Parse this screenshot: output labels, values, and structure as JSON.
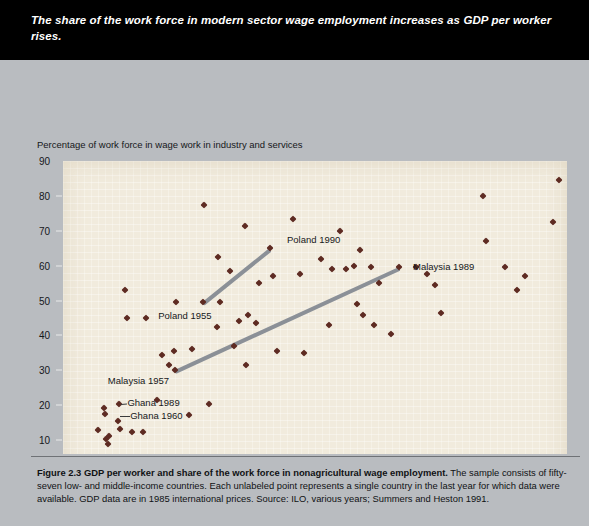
{
  "header": {
    "title": "The share of the work force in modern sector wage employment increases as GDP per worker rises."
  },
  "caption": {
    "figure_label": "Figure 2.3",
    "figure_title": "GDP per worker and share of the work force in nonagricultural wage employment.",
    "body": "The sample consists of fifty-seven low- and middle-income countries. Each unlabeled point represents a single country in the last year for which data were available. GDP data are in 1985 international prices. Source: ILO, various years; Summers and Heston 1991."
  },
  "chart_data": {
    "type": "scatter",
    "title": "",
    "ylabel": "Percentage of work force in wage work in industry and services",
    "xlabel": "GDP per worker (thousands of dollars)",
    "xlim": [
      0,
      18
    ],
    "ylim": [
      0,
      90
    ],
    "xticks": [
      0,
      2,
      4,
      6,
      8,
      10,
      12,
      14,
      16,
      18
    ],
    "yticks": [
      0,
      10,
      20,
      30,
      40,
      50,
      60,
      70,
      80,
      90
    ],
    "grid": false,
    "legend": "none",
    "plot_background": "#f1ebdd",
    "marker_color": "#5e2b22",
    "trend_color": "#8b9097",
    "points": [
      [
        1.25,
        13.0
      ],
      [
        1.45,
        19.2
      ],
      [
        1.5,
        17.5
      ],
      [
        1.55,
        10.2
      ],
      [
        1.6,
        9.0
      ],
      [
        1.65,
        11.3
      ],
      [
        1.95,
        15.5
      ],
      [
        2.0,
        20.3
      ],
      [
        2.05,
        13.2
      ],
      [
        2.2,
        53.0
      ],
      [
        2.3,
        45.0
      ],
      [
        2.45,
        12.3
      ],
      [
        2.85,
        12.3
      ],
      [
        2.95,
        45.0
      ],
      [
        3.35,
        21.5
      ],
      [
        3.55,
        34.5
      ],
      [
        3.8,
        31.5
      ],
      [
        3.95,
        35.5
      ],
      [
        4.0,
        30.0
      ],
      [
        4.05,
        49.5
      ],
      [
        4.5,
        17.2
      ],
      [
        4.6,
        36.0
      ],
      [
        5.0,
        49.5
      ],
      [
        5.05,
        77.5
      ],
      [
        5.2,
        20.3
      ],
      [
        5.5,
        42.5
      ],
      [
        5.55,
        62.5
      ],
      [
        5.6,
        49.5
      ],
      [
        5.95,
        58.5
      ],
      [
        6.1,
        37.0
      ],
      [
        6.3,
        44.0
      ],
      [
        6.5,
        71.5
      ],
      [
        6.55,
        31.5
      ],
      [
        6.6,
        46.0
      ],
      [
        6.9,
        43.5
      ],
      [
        7.0,
        55.0
      ],
      [
        7.4,
        65.0
      ],
      [
        7.5,
        57.0
      ],
      [
        7.65,
        35.5
      ],
      [
        8.2,
        73.5
      ],
      [
        8.45,
        57.5
      ],
      [
        8.6,
        35.0
      ],
      [
        9.2,
        62.0
      ],
      [
        9.5,
        43.0
      ],
      [
        9.6,
        59.0
      ],
      [
        9.9,
        70.0
      ],
      [
        10.1,
        59.0
      ],
      [
        10.4,
        60.0
      ],
      [
        10.5,
        49.0
      ],
      [
        10.6,
        64.5
      ],
      [
        10.7,
        46.0
      ],
      [
        11.0,
        59.5
      ],
      [
        11.1,
        43.0
      ],
      [
        11.3,
        55.0
      ],
      [
        11.7,
        40.5
      ],
      [
        12.0,
        59.5
      ],
      [
        12.6,
        59.5
      ],
      [
        13.0,
        57.5
      ],
      [
        13.3,
        54.5
      ],
      [
        13.5,
        46.5
      ],
      [
        15.0,
        80.0
      ],
      [
        15.1,
        67.0
      ],
      [
        15.8,
        59.5
      ],
      [
        16.2,
        53.0
      ],
      [
        16.5,
        57.0
      ],
      [
        17.5,
        72.5
      ],
      [
        17.7,
        84.5
      ]
    ],
    "trend_lines": [
      {
        "name": "Poland",
        "from": [
          5.0,
          49.5
        ],
        "to": [
          7.4,
          65.0
        ]
      },
      {
        "name": "Malaysia",
        "from": [
          4.0,
          30.0
        ],
        "to": [
          12.0,
          59.5
        ]
      }
    ],
    "annotations": [
      {
        "name": "poland-1990",
        "text": "Poland 1990",
        "x": 7.4,
        "y": 65.0,
        "label_x": 8.0,
        "label_y": 67.5
      },
      {
        "name": "poland-1955",
        "text": "Poland 1955",
        "x": 5.0,
        "y": 49.5,
        "label_x": 3.4,
        "label_y": 45.5
      },
      {
        "name": "malaysia-1989",
        "text": "Malaysia 1989",
        "x": 12.0,
        "y": 59.5,
        "label_x": 12.5,
        "label_y": 59.5
      },
      {
        "name": "malaysia-1957",
        "text": "Malaysia 1957",
        "x": 4.0,
        "y": 30.0,
        "label_x": 1.6,
        "label_y": 27.0
      },
      {
        "name": "ghana-1989",
        "text": "Ghana 1989",
        "x": 2.0,
        "y": 20.3,
        "label_x": 2.3,
        "label_y": 20.5
      },
      {
        "name": "ghana-1960",
        "text": "Ghana 1960",
        "x": 1.95,
        "y": 17.0,
        "label_x": 2.4,
        "label_y": 17.0
      }
    ]
  }
}
